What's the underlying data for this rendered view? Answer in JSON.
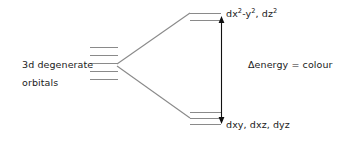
{
  "diagram": {
    "type": "energy-level-diagram",
    "stroke_color": "#8a8a8a",
    "arrow_color": "#111111",
    "text_color": "#1a1a1a",
    "background_color": "#ffffff"
  },
  "labels": {
    "left_line1": "3d degenerate",
    "left_line2": "orbitals",
    "upper_set_prefix": "dx",
    "upper_set_sup1": "2",
    "upper_set_mid": "-y",
    "upper_set_sup2": "2",
    "upper_set_sep": ", dz",
    "upper_set_sup3": "2",
    "upper_set_full": "dx2-y2, dz2",
    "lower_set": "dxy, dxz, dyz",
    "delta_text": "Δenergy = colour"
  },
  "levels": {
    "degenerate": {
      "name": "3d degenerate orbitals",
      "count": 5,
      "x_start": 90,
      "x_end": 118,
      "y_positions": [
        47,
        55,
        63,
        71,
        79
      ]
    },
    "upper": {
      "name": "eg set",
      "count": 2,
      "x_start": 190,
      "x_end": 221,
      "y_positions": [
        13,
        20
      ]
    },
    "lower": {
      "name": "t2g set",
      "count": 3,
      "x_start": 190,
      "x_end": 221,
      "y_positions": [
        112,
        118,
        124
      ]
    }
  },
  "connectors": [
    {
      "name": "upper-connector",
      "x1": 118,
      "y1": 64,
      "x2": 190,
      "y2": 13
    },
    {
      "name": "lower-connector",
      "x1": 118,
      "y1": 66,
      "x2": 190,
      "y2": 118
    }
  ],
  "delta_arrow": {
    "name": "splitting-energy-arrow",
    "x": 221,
    "y_top": 20,
    "y_bottom": 120,
    "double_headed": true
  }
}
